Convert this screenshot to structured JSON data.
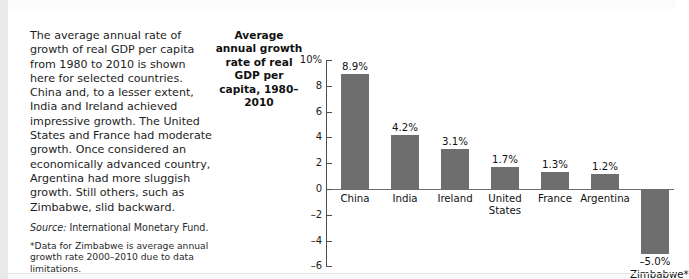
{
  "page": {
    "running_head": "",
    "figure_caption": "The average annual rate of growth of real GDP per capita from 1980 to 2010 is shown here for selected countries. China and, to a lesser extent, India and Ireland achieved impressive growth. The United States and France had moderate growth. Once considered an economically advanced country, Argentina had more sluggish growth. Still others, such as Zimbabwe, slid backward.",
    "source_label": "Source:",
    "source_text": " International Monetary Fund.",
    "footnote": "*Data for Zimbabwe is average annual growth rate 2000–2010 due to data limitations."
  },
  "chart_data": {
    "type": "bar",
    "title": "Average annual growth rate of real GDP per capita, 1980–2010",
    "xlabel": "",
    "ylabel": "",
    "ylim": [
      -6,
      10
    ],
    "grid": false,
    "legend": "none",
    "bar_color": "#6e6e6e",
    "axis_color": "#4d4d4d",
    "tick_labels": [
      "10%",
      "8",
      "6",
      "4",
      "2",
      "0",
      "–2",
      "–4",
      "–6"
    ],
    "tick_values": [
      10,
      8,
      6,
      4,
      2,
      0,
      -2,
      -4,
      -6
    ],
    "categories": [
      "China",
      "India",
      "Ireland",
      "United States",
      "France",
      "Argentina",
      "Zimbabwe*"
    ],
    "values": [
      8.9,
      4.2,
      3.1,
      1.7,
      1.3,
      1.2,
      -5.0
    ],
    "value_labels": [
      "8.9%",
      "4.2%",
      "3.1%",
      "1.7%",
      "1.3%",
      "1.2%",
      "–5.0%"
    ],
    "category_lines": [
      [
        "China"
      ],
      [
        "India"
      ],
      [
        "Ireland"
      ],
      [
        "United",
        "States"
      ],
      [
        "France"
      ],
      [
        "Argentina"
      ],
      [
        "Zimbabwe*"
      ]
    ]
  }
}
